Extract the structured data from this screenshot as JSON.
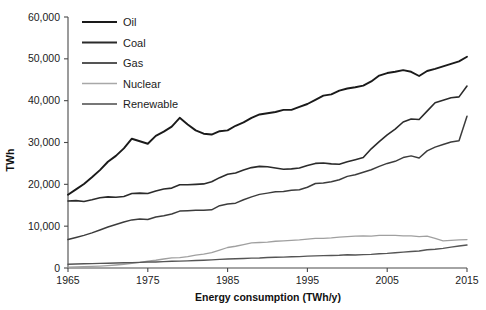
{
  "chart_data": {
    "type": "line",
    "title": "",
    "xlabel": "Energy consumption (TWh/y)",
    "ylabel": "TWh",
    "xlim": [
      1965,
      2015
    ],
    "ylim": [
      0,
      60000
    ],
    "grid": false,
    "legend_position": "top-left",
    "xticks": [
      "1965",
      "1975",
      "1985",
      "1995",
      "2005",
      "2015"
    ],
    "xtick_values": [
      1965,
      1975,
      1985,
      1995,
      2005,
      2015
    ],
    "yticks": [
      "0",
      "10,000",
      "20,000",
      "30,000",
      "40,000",
      "50,000",
      "60,000"
    ],
    "ytick_values": [
      0,
      10000,
      20000,
      30000,
      40000,
      50000,
      60000
    ],
    "x": [
      1965,
      1966,
      1967,
      1968,
      1969,
      1970,
      1971,
      1972,
      1973,
      1974,
      1975,
      1976,
      1977,
      1978,
      1979,
      1980,
      1981,
      1982,
      1983,
      1984,
      1985,
      1986,
      1987,
      1988,
      1989,
      1990,
      1991,
      1992,
      1993,
      1994,
      1995,
      1996,
      1997,
      1998,
      1999,
      2000,
      2001,
      2002,
      2003,
      2004,
      2005,
      2006,
      2007,
      2008,
      2009,
      2010,
      2011,
      2012,
      2013,
      2014,
      2015
    ],
    "series": [
      {
        "name": "Oil",
        "color": "#1a1a1a",
        "width": 1.9,
        "values": [
          17500,
          18800,
          20100,
          21700,
          23400,
          25400,
          26800,
          28600,
          30900,
          30300,
          29700,
          31600,
          32600,
          33800,
          35900,
          34300,
          32900,
          32100,
          31900,
          32700,
          32900,
          34000,
          34800,
          35900,
          36700,
          37000,
          37300,
          37800,
          37800,
          38500,
          39200,
          40200,
          41200,
          41500,
          42400,
          42900,
          43200,
          43600,
          44600,
          46000,
          46600,
          46900,
          47300,
          46900,
          45900,
          47100,
          47600,
          48200,
          48800,
          49400,
          50500
        ]
      },
      {
        "name": "Coal",
        "color": "#2b2b2b",
        "width": 1.6,
        "values": [
          16000,
          16100,
          15900,
          16300,
          16800,
          17000,
          16900,
          17100,
          17800,
          17900,
          17800,
          18400,
          18900,
          19100,
          19900,
          19900,
          20000,
          20100,
          20600,
          21600,
          22400,
          22700,
          23400,
          24000,
          24300,
          24200,
          23900,
          23600,
          23700,
          23900,
          24500,
          25000,
          25100,
          24900,
          24800,
          25400,
          25900,
          26400,
          28500,
          30200,
          31800,
          33200,
          34900,
          35600,
          35500,
          37500,
          39500,
          40100,
          40700,
          40900,
          43500
        ]
      },
      {
        "name": "Gas",
        "color": "#3c3c3c",
        "width": 1.5,
        "values": [
          6800,
          7300,
          7800,
          8400,
          9100,
          9800,
          10400,
          11000,
          11500,
          11700,
          11600,
          12200,
          12500,
          12900,
          13600,
          13700,
          13800,
          13800,
          13900,
          14900,
          15300,
          15500,
          16300,
          17000,
          17600,
          17900,
          18200,
          18300,
          18600,
          18700,
          19300,
          20200,
          20300,
          20600,
          21100,
          21900,
          22300,
          22900,
          23500,
          24300,
          25000,
          25500,
          26400,
          26800,
          26300,
          28000,
          28900,
          29500,
          30100,
          30400,
          36300
        ]
      },
      {
        "name": "Nuclear",
        "color": "#a0a0a0",
        "width": 1.3,
        "values": [
          200,
          250,
          300,
          380,
          470,
          580,
          720,
          900,
          1100,
          1350,
          1650,
          1850,
          2150,
          2400,
          2500,
          2700,
          3100,
          3300,
          3700,
          4300,
          4900,
          5200,
          5600,
          6000,
          6100,
          6200,
          6400,
          6500,
          6600,
          6700,
          6900,
          7100,
          7100,
          7200,
          7400,
          7500,
          7600,
          7700,
          7600,
          7800,
          7800,
          7800,
          7700,
          7700,
          7500,
          7600,
          7100,
          6500,
          6600,
          6700,
          6800
        ]
      },
      {
        "name": "Renewable",
        "color": "#555555",
        "width": 1.4,
        "values": [
          900,
          950,
          1000,
          1050,
          1100,
          1150,
          1200,
          1250,
          1280,
          1350,
          1420,
          1450,
          1520,
          1600,
          1650,
          1700,
          1780,
          1850,
          1950,
          2050,
          2150,
          2200,
          2280,
          2350,
          2400,
          2500,
          2560,
          2600,
          2700,
          2720,
          2850,
          2900,
          2950,
          3000,
          3050,
          3150,
          3100,
          3200,
          3250,
          3400,
          3500,
          3650,
          3800,
          3950,
          4050,
          4350,
          4500,
          4700,
          5000,
          5250,
          5500
        ]
      }
    ],
    "legend": [
      {
        "label": "Oil",
        "color": "#1a1a1a",
        "width": 2.2
      },
      {
        "label": "Coal",
        "color": "#2b2b2b",
        "width": 1.9
      },
      {
        "label": "Gas",
        "color": "#555555",
        "width": 1.8
      },
      {
        "label": "Nuclear",
        "color": "#a8a8a8",
        "width": 1.4
      },
      {
        "label": "Renewable",
        "color": "#4a4a4a",
        "width": 1.6
      }
    ]
  }
}
